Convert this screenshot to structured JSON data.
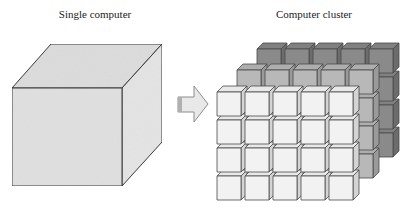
{
  "diagram": {
    "left_panel": {
      "title": "Single computer",
      "shape": "large-cube",
      "face_color": "#e2e2e2"
    },
    "arrow": {
      "direction": "right",
      "color": "#e6e6e6",
      "stroke": "#9a9a9a"
    },
    "right_panel": {
      "title": "Computer cluster",
      "shape": "grid-of-cubes",
      "layers": [
        {
          "name": "back",
          "columns": 5,
          "rows": 4,
          "color": "#8a8a8a"
        },
        {
          "name": "middle",
          "columns": 5,
          "rows": 4,
          "color": "#b8b8b8"
        },
        {
          "name": "front",
          "columns": 5,
          "rows": 4,
          "color": "#f2f2f2"
        }
      ]
    }
  }
}
